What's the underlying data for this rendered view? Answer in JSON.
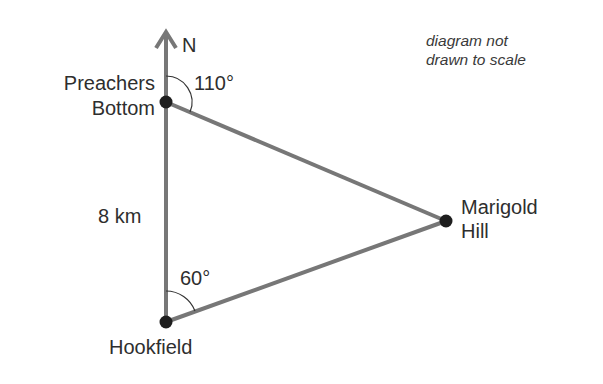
{
  "diagram": {
    "note": [
      "diagram not",
      "drawn to scale"
    ],
    "north_label": "N",
    "points": {
      "preachers_bottom": {
        "label_line1": "Preachers",
        "label_line2": "Bottom"
      },
      "hookfield": {
        "label": "Hookfield"
      },
      "marigold_hill": {
        "label_line1": "Marigold",
        "label_line2": "Hill"
      }
    },
    "angles": {
      "preachers_bottom": "110°",
      "hookfield": "60°"
    },
    "distance": "8 km",
    "colors": {
      "line": "#777777",
      "dot": "#1e1e1e",
      "text": "#2e2e2e"
    }
  }
}
